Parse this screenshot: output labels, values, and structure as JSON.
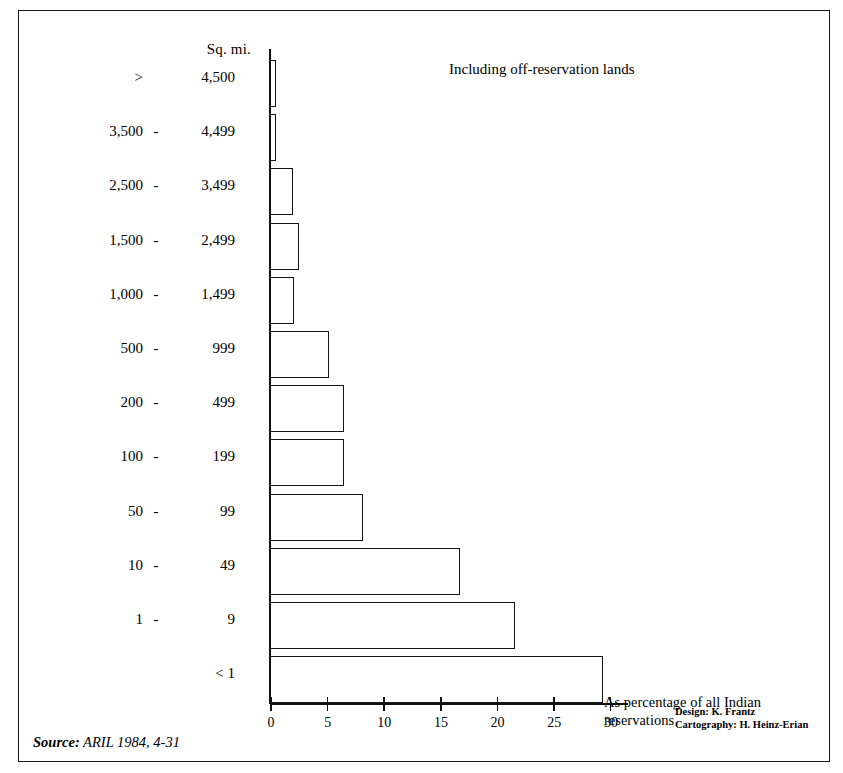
{
  "figure": {
    "axis_title": "Sq. mi.",
    "note_top_right": "Including off-reservation lands",
    "axis_caption_line1": "As percentage of all Indian",
    "axis_caption_line2": "reservations",
    "credit_design": "Design: K. Frantz",
    "credit_cartography": "Cartography: H. Heinz-Erian",
    "source_word": "Source:",
    "source_text": "ARIL 1984, 4-31",
    "frame_color": "#1a1a1a",
    "bar_outline_color": "#141414",
    "bar_fill_color": "#ffffff"
  },
  "chart_data": {
    "type": "bar",
    "orientation": "horizontal",
    "title": "",
    "subtitle": "",
    "xlabel": "As percentage of all Indian reservations",
    "ylabel": "Sq. mi.",
    "xlim": [
      0,
      30
    ],
    "grid": false,
    "legend": "none",
    "annotations": [
      "Including off-reservation lands"
    ],
    "xticks": [
      0,
      5,
      10,
      15,
      20,
      25,
      30
    ],
    "xtick_labels": [
      "0",
      "5",
      "10",
      "15",
      "20",
      "25",
      "30"
    ],
    "categories": [
      "> 4,500",
      "3,500 - 4,499",
      "2,500 - 3,499",
      "1,500 - 2,499",
      "1,000 - 1,499",
      "500 - 999",
      "200 - 499",
      "100 - 199",
      "50 - 99",
      "10 - 49",
      "1 - 9",
      "< 1"
    ],
    "values": [
      0.5,
      0.5,
      2.0,
      2.6,
      2.1,
      5.2,
      6.5,
      6.5,
      8.2,
      16.8,
      21.6,
      29.4
    ],
    "rows": [
      {
        "lo": ">",
        "dash": "",
        "hi": "4,500",
        "single": false,
        "value": 0.5
      },
      {
        "lo": "3,500",
        "dash": "-",
        "hi": "4,499",
        "single": false,
        "value": 0.5
      },
      {
        "lo": "2,500",
        "dash": "-",
        "hi": "3,499",
        "single": false,
        "value": 2.0
      },
      {
        "lo": "1,500",
        "dash": "-",
        "hi": "2,499",
        "single": false,
        "value": 2.6
      },
      {
        "lo": "1,000",
        "dash": "-",
        "hi": "1,499",
        "single": false,
        "value": 2.1
      },
      {
        "lo": "500",
        "dash": "-",
        "hi": "999",
        "single": false,
        "value": 5.2
      },
      {
        "lo": "200",
        "dash": "-",
        "hi": "499",
        "single": false,
        "value": 6.5
      },
      {
        "lo": "100",
        "dash": "-",
        "hi": "199",
        "single": false,
        "value": 6.5
      },
      {
        "lo": "50",
        "dash": "-",
        "hi": "99",
        "single": false,
        "value": 8.2
      },
      {
        "lo": "10",
        "dash": "-",
        "hi": "49",
        "single": false,
        "value": 16.8
      },
      {
        "lo": "1",
        "dash": "-",
        "hi": "9",
        "single": false,
        "value": 21.6
      },
      {
        "lo": "",
        "dash": "",
        "hi": "< 1",
        "single": true,
        "value": 29.4
      }
    ]
  }
}
